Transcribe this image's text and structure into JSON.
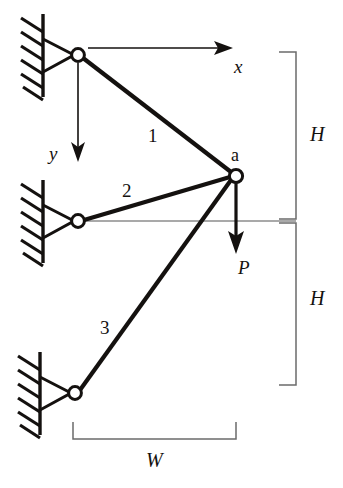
{
  "figure": {
    "type": "engineering-diagram",
    "background_color": "#ffffff",
    "line_color": "#14110f",
    "reference_line_color": "#8c8c8c",
    "dimension_line_color": "#6b6b6b"
  },
  "members": [
    {
      "id": "member-1",
      "label": "1",
      "from": "top-support-pin",
      "to": "joint-a"
    },
    {
      "id": "member-2",
      "label": "2",
      "from": "middle-support-pin",
      "to": "joint-a"
    },
    {
      "id": "member-3",
      "label": "3",
      "from": "bottom-support-pin",
      "to": "joint-a"
    }
  ],
  "joints": {
    "a": {
      "label": "a"
    }
  },
  "supports": [
    {
      "id": "top-support",
      "type": "pinned",
      "hatch_lines": 6
    },
    {
      "id": "middle-support",
      "type": "pinned",
      "hatch_lines": 6
    },
    {
      "id": "bottom-support",
      "type": "pinned",
      "hatch_lines": 6
    }
  ],
  "axes": {
    "x": {
      "label": "x",
      "direction": "right"
    },
    "y": {
      "label": "y",
      "direction": "down"
    }
  },
  "load": {
    "label": "P",
    "direction": "down",
    "applied_at": "joint-a"
  },
  "dimensions": {
    "height_upper": {
      "label": "H"
    },
    "height_lower": {
      "label": "H"
    },
    "width": {
      "label": "W"
    }
  }
}
